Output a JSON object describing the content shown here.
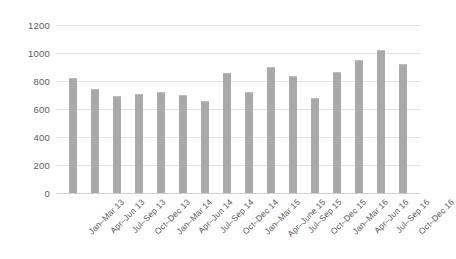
{
  "chart_data": {
    "type": "bar",
    "title": "",
    "xlabel": "",
    "ylabel": "",
    "ylim": [
      0,
      1200
    ],
    "ytick_step": 200,
    "yticks": [
      1200,
      1000,
      800,
      600,
      400,
      200,
      0
    ],
    "ytick_labels": [
      "1200",
      "1000",
      "800",
      "600",
      "400",
      "200",
      "0"
    ],
    "grid": true,
    "legend": false,
    "bar_color": "#a9a9a9",
    "background_color": "#ffffff",
    "gridline_color": "#e4e4e4",
    "categories": [
      "Jan–Mar 13",
      "Apr–Jun 13",
      "Jul–Sep 13",
      "Oct–Dec 13",
      "Jan–Mar 14",
      "Apr–Jun 14",
      "Jul–Sep 14",
      "Oct–Dec 14",
      "Jan–Mar 15",
      "Apr–June 15",
      "Jul–Sep 15",
      "Oct–Dec 15",
      "Jan–Mar 16",
      "Apr–Jun 16",
      "Jul–Sep 16",
      "Oct–Dec 16"
    ],
    "values": [
      820,
      740,
      695,
      705,
      725,
      700,
      655,
      855,
      725,
      900,
      835,
      680,
      865,
      950,
      1025,
      920
    ]
  }
}
